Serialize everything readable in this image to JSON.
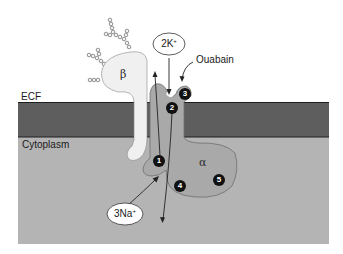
{
  "diagram": {
    "regions": {
      "ecf_label": "ECF",
      "cytoplasm_label": "Cytoplasm"
    },
    "subunits": {
      "beta_label": "β",
      "alpha_label": "α"
    },
    "ions": {
      "potassium": {
        "count": "2K",
        "charge": "+"
      },
      "sodium": {
        "count": "3Na",
        "charge": "+"
      }
    },
    "inhibitor_label": "Ouabain",
    "steps": [
      "1",
      "2",
      "3",
      "4",
      "5"
    ],
    "colors": {
      "ecf": "#ffffff",
      "membrane": "#5e5e5e",
      "membrane_edge": "#1e1e1e",
      "cytoplasm": "#b4b4b4",
      "alpha_subunit": "#a9a9a9",
      "beta_subunit": "#f0f0f0",
      "step_marker": "#111111"
    }
  }
}
